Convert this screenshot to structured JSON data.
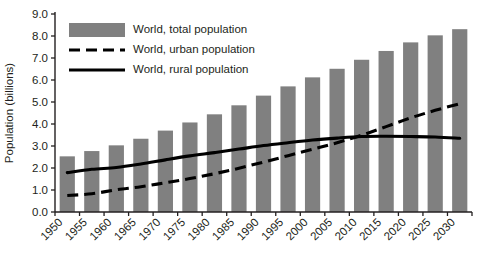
{
  "chart_data": {
    "type": "bar",
    "title": "",
    "xlabel": "",
    "ylabel": "Population (billions)",
    "ylim": [
      0.0,
      9.0
    ],
    "ytick_labels": [
      "0.0",
      "1.0",
      "2.0",
      "3.0",
      "4.0",
      "5.0",
      "6.0",
      "7.0",
      "8.0",
      "9.0"
    ],
    "ytick_values": [
      0.0,
      1.0,
      2.0,
      3.0,
      4.0,
      5.0,
      6.0,
      7.0,
      8.0,
      9.0
    ],
    "grid": false,
    "legend_position": "top-left",
    "categories": [
      "1950",
      "1955",
      "1960",
      "1965",
      "1970",
      "1975",
      "1980",
      "1985",
      "1990",
      "1995",
      "2000",
      "2005",
      "2010",
      "2015",
      "2020",
      "2025",
      "2030"
    ],
    "series": [
      {
        "name": "World, total population",
        "render": "bar",
        "color": "#808080",
        "values": [
          2.53,
          2.77,
          3.03,
          3.33,
          3.7,
          4.07,
          4.44,
          4.85,
          5.29,
          5.71,
          6.12,
          6.51,
          6.92,
          7.32,
          7.71,
          8.03,
          8.31
        ]
      },
      {
        "name": "World, urban population",
        "render": "dashed-line",
        "color": "#000000",
        "values": [
          0.75,
          0.83,
          1.01,
          1.15,
          1.33,
          1.52,
          1.74,
          1.99,
          2.27,
          2.56,
          2.85,
          3.15,
          3.49,
          3.88,
          4.28,
          4.62,
          4.92
        ]
      },
      {
        "name": "World, rural population",
        "render": "solid-line",
        "color": "#000000",
        "values": [
          1.79,
          1.94,
          2.02,
          2.18,
          2.37,
          2.55,
          2.7,
          2.86,
          3.02,
          3.15,
          3.27,
          3.36,
          3.43,
          3.44,
          3.43,
          3.41,
          3.35
        ]
      }
    ],
    "legend": [
      {
        "label": "World, total population",
        "marker": "swatch",
        "color": "#808080"
      },
      {
        "label": "World, urban population",
        "marker": "dashed-line",
        "color": "#000000"
      },
      {
        "label": "World, rural population",
        "marker": "solid-line",
        "color": "#000000"
      }
    ]
  }
}
